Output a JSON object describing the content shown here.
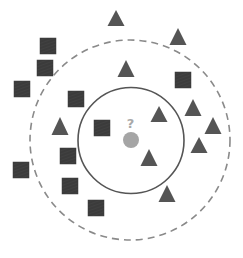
{
  "diagram": {
    "type": "k-nearest-neighbors illustration",
    "colors": {
      "background": "#ffffff",
      "square": "#3b3b3b",
      "triangle": "#555555",
      "query_point": "#a5a5a5",
      "question_mark": "#a9a9a9",
      "inner_circle": "#555555",
      "outer_circle": "#8a8a8a"
    },
    "query_point": {
      "cx": 131,
      "cy": 140,
      "r": 8,
      "label": "?"
    },
    "inner_circle": {
      "cx": 131,
      "cy": 140.5,
      "r": 53,
      "style": "solid",
      "k": 3
    },
    "outer_circle": {
      "cx": 130,
      "cy": 140,
      "r": 100,
      "style": "dashed",
      "k": 5
    },
    "squares": [
      {
        "cx": 48,
        "cy": 46
      },
      {
        "cx": 45,
        "cy": 68
      },
      {
        "cx": 22,
        "cy": 89
      },
      {
        "cx": 76,
        "cy": 99
      },
      {
        "cx": 102,
        "cy": 128
      },
      {
        "cx": 183,
        "cy": 80
      },
      {
        "cx": 21,
        "cy": 170
      },
      {
        "cx": 68,
        "cy": 156
      },
      {
        "cx": 70,
        "cy": 186
      },
      {
        "cx": 96,
        "cy": 208
      }
    ],
    "triangles": [
      {
        "apex_x": 116,
        "apex_y": 10,
        "base_y": 26
      },
      {
        "apex_x": 178,
        "apex_y": 28,
        "base_y": 45
      },
      {
        "apex_x": 126,
        "apex_y": 60,
        "base_y": 77
      },
      {
        "apex_x": 60,
        "apex_y": 117,
        "base_y": 135
      },
      {
        "apex_x": 159,
        "apex_y": 106,
        "base_y": 122
      },
      {
        "apex_x": 193,
        "apex_y": 99,
        "base_y": 116
      },
      {
        "apex_x": 213,
        "apex_y": 117,
        "base_y": 134
      },
      {
        "apex_x": 199,
        "apex_y": 137,
        "base_y": 153
      },
      {
        "apex_x": 149,
        "apex_y": 149,
        "base_y": 166
      },
      {
        "apex_x": 167,
        "apex_y": 185,
        "base_y": 202
      }
    ],
    "square_size": 16,
    "triangle_half_width": 8.5
  }
}
